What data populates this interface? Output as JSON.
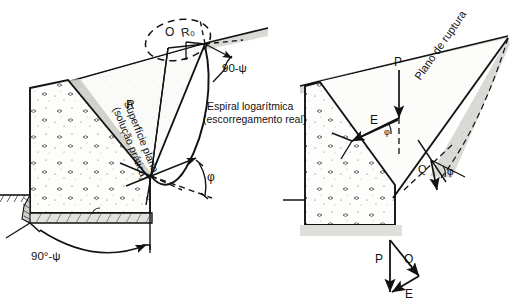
{
  "figure": {
    "panels": [
      {
        "id": "left",
        "name": "logarithmic-spiral-method",
        "labels": {
          "center_point": "O",
          "initial_radius": "R₀",
          "radius": "R",
          "plane_surface_line1": "Superfície plano",
          "plane_surface_line2": "(solução prática)",
          "spiral_line1": "Espiral logarítmica",
          "spiral_line2": "(escorregamento real)",
          "angle_top": "90-ψ",
          "angle_bottom": "90°-ψ",
          "angle_phi": "φ"
        }
      },
      {
        "id": "right",
        "name": "force-equilibrium-method",
        "labels": {
          "force_p": "P",
          "force_e": "E",
          "force_q": "Q",
          "rupture_plane": "Plano de ruptura",
          "angle_phi_wall": "φ",
          "angle_phi_plane": "φ"
        }
      },
      {
        "id": "force-triangle",
        "name": "force-polygon",
        "labels": {
          "force_p": "P",
          "force_q": "Q",
          "force_e": "E"
        }
      }
    ],
    "colors": {
      "ink": "#121212",
      "soil_fill": "#d8d8d4",
      "concrete_fill": "#fbfbfa",
      "paper": "#ffffff"
    }
  }
}
